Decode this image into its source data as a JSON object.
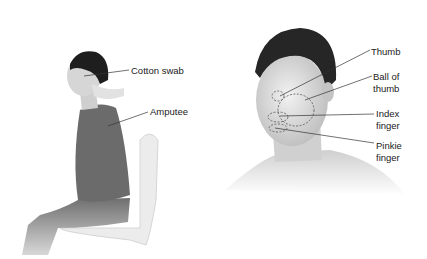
{
  "left_panel": {
    "labels": [
      {
        "text": "Cotton swab"
      },
      {
        "text": "Amputee"
      }
    ]
  },
  "right_panel": {
    "labels": [
      {
        "text": "Thumb"
      },
      {
        "text": "Ball of"
      },
      {
        "text": "thumb"
      },
      {
        "text": "Index"
      },
      {
        "text": "finger"
      },
      {
        "text": "Pinkie"
      },
      {
        "text": "finger"
      }
    ]
  },
  "colors": {
    "background": "#ffffff",
    "hair": "#1e1e1e",
    "skin": "#d9d9d9",
    "shirt": "#6b6b6b",
    "pants": "#7a7a7a",
    "chair": "#e6e6e6",
    "leader_line": "#333333"
  }
}
